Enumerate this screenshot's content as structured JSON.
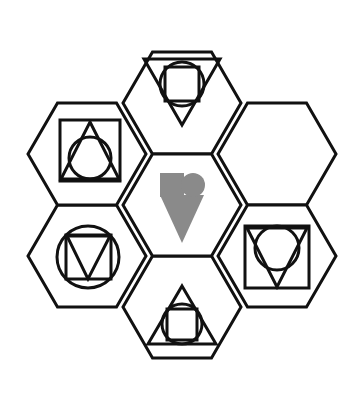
{
  "figure": {
    "title": "Hexagonal shape-matrix puzzle",
    "background_color": "#ffffff",
    "outline_color": "#111111",
    "glyph_color": "#111111",
    "fill_color": "#8a8a8a",
    "layout": "seven flat-top hexagons in a flower arrangement: one center hexagon surrounded by six",
    "hex_width": 118,
    "hex_height": 102,
    "outline_width": 3,
    "glyph_width": 3
  },
  "cells": [
    {
      "id": "hex-top",
      "name": "top",
      "cx": 182,
      "cy": 103,
      "filled": false,
      "empty": false,
      "description": "downward triangle containing a circle containing a square",
      "shapes": [
        "triangle-down",
        "circle",
        "square"
      ]
    },
    {
      "id": "hex-top-right",
      "name": "top-right",
      "cx": 277,
      "cy": 154,
      "filled": false,
      "empty": true,
      "description": "empty hexagon (missing element)",
      "shapes": []
    },
    {
      "id": "hex-bottom-right",
      "name": "bottom-right",
      "cx": 277,
      "cy": 256,
      "filled": false,
      "empty": false,
      "description": "square containing a downward triangle with a circle at the top",
      "shapes": [
        "square",
        "triangle-down",
        "circle"
      ]
    },
    {
      "id": "hex-bottom",
      "name": "bottom",
      "cx": 182,
      "cy": 307,
      "filled": false,
      "empty": false,
      "description": "upward triangle containing a circle containing a square",
      "shapes": [
        "triangle-up",
        "circle",
        "square"
      ]
    },
    {
      "id": "hex-bottom-left",
      "name": "bottom-left",
      "cx": 87,
      "cy": 256,
      "filled": false,
      "empty": false,
      "description": "circle containing a square containing a downward triangle",
      "shapes": [
        "circle",
        "square",
        "triangle-down"
      ]
    },
    {
      "id": "hex-top-left",
      "name": "top-left",
      "cx": 87,
      "cy": 154,
      "filled": false,
      "empty": false,
      "description": "square containing an upward triangle with a circle at the bottom",
      "shapes": [
        "square",
        "triangle-up",
        "circle"
      ]
    },
    {
      "id": "hex-center",
      "name": "center",
      "cx": 182,
      "cy": 205,
      "filled": true,
      "empty": false,
      "description": "solid grey square and circle side by side above a solid grey downward triangle",
      "shapes": [
        "square-filled",
        "circle-filled",
        "triangle-down-filled"
      ]
    }
  ],
  "chart_data": {
    "type": "diagram",
    "title": "Hexagonal shape-matrix puzzle",
    "cell_count": 7,
    "empty_cell": "top-right",
    "legend": []
  }
}
